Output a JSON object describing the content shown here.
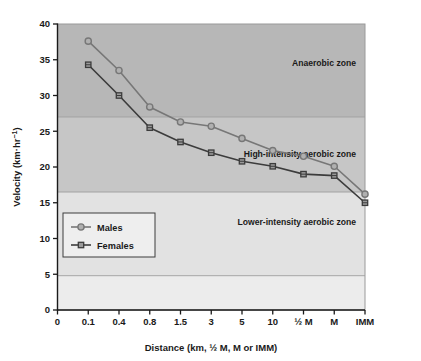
{
  "chart_data": {
    "type": "line",
    "title": "",
    "xlabel": "Distance (km, ½ M, M or IMM)",
    "ylabel": "Velocity (km·hr⁻¹)",
    "categories": [
      "0.1",
      "0.4",
      "0.8",
      "1.5",
      "3",
      "5",
      "10",
      "½ M",
      "M",
      "IMM"
    ],
    "xticklabels": [
      "0",
      "0.1",
      "0.4",
      "0.8",
      "1.5",
      "3",
      "5",
      "10",
      "½ M",
      "M",
      "IMM"
    ],
    "yticklabels": [
      "0",
      "5",
      "10",
      "15",
      "20",
      "25",
      "30",
      "35",
      "40"
    ],
    "ylim": [
      0,
      40
    ],
    "ytick_step": 5,
    "grid": false,
    "legend_position": "lower-left-inside",
    "series": [
      {
        "name": "Males",
        "marker": "circle",
        "color": "#777777",
        "values": [
          37.6,
          33.5,
          28.4,
          26.3,
          25.7,
          24.0,
          22.3,
          21.5,
          20.1,
          16.2
        ]
      },
      {
        "name": "Females",
        "marker": "square",
        "color": "#3c3c3c",
        "values": [
          34.3,
          30.0,
          25.5,
          23.5,
          22.0,
          20.8,
          20.1,
          19.0,
          18.8,
          15.0
        ]
      }
    ],
    "zones": [
      {
        "label": "Anaerobic zone",
        "from": 27.0,
        "to": 40.0,
        "color": "#b7b7b7"
      },
      {
        "label": "High-intensity aerobic zone",
        "from": 16.5,
        "to": 27.0,
        "color": "#c6c6c6"
      },
      {
        "label": "Lower-intensity aerobic zone",
        "from": 4.8,
        "to": 16.5,
        "color": "#e2e2e2"
      },
      {
        "label": "",
        "from": 0.0,
        "to": 4.8,
        "color": "#ececec"
      }
    ]
  },
  "legend": {
    "entries": [
      {
        "label": "Males"
      },
      {
        "label": "Females"
      }
    ]
  },
  "colors": {
    "males_line": "#777777",
    "females_line": "#3c3c3c",
    "axis": "#1a1a1a",
    "plot_border": "#9a9a9a",
    "text": "#1a1a1a"
  }
}
